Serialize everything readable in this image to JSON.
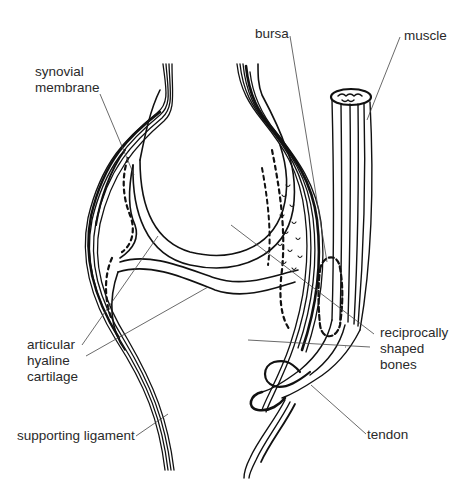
{
  "diagram": {
    "labels": {
      "synovial_membrane": [
        "synovial",
        "membrane"
      ],
      "bursa": "bursa",
      "muscle": "muscle",
      "articular_hyaline_cartilage": [
        "articular",
        "hyaline",
        "cartilage"
      ],
      "reciprocally_shaped_bones": [
        "reciprocally",
        "shaped",
        "bones"
      ],
      "supporting_ligament": "supporting ligament",
      "tendon": "tendon"
    },
    "colors": {
      "ink": "#111111",
      "leader": "#444444",
      "background": "#ffffff"
    }
  }
}
